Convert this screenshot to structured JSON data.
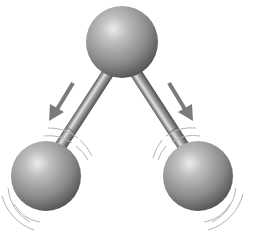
{
  "diagram": {
    "type": "molecular-vibration",
    "background": "#ffffff",
    "colors": {
      "atom_highlight": "#e6e6e6",
      "atom_mid": "#9a9a9a",
      "atom_shadow": "#4a4a4a",
      "bond_light": "#d8d8d8",
      "bond_dark": "#555555",
      "arrow": "#7a7a7a",
      "vibration_lines": "#b0b0b0"
    },
    "atoms": [
      {
        "id": "center-atom",
        "cx": 122,
        "cy": 42,
        "r": 36
      },
      {
        "id": "left-atom",
        "cx": 46,
        "cy": 176,
        "r": 35
      },
      {
        "id": "right-atom",
        "cx": 198,
        "cy": 176,
        "r": 35
      }
    ],
    "bonds": [
      {
        "id": "left-bond",
        "from": "center-atom",
        "to": "left-atom"
      },
      {
        "id": "right-bond",
        "from": "center-atom",
        "to": "right-atom"
      }
    ],
    "arrows": [
      {
        "id": "left-arrow",
        "x1": 73,
        "y1": 83,
        "x2": 52,
        "y2": 118,
        "direction": "down-left"
      },
      {
        "id": "right-arrow",
        "x1": 169,
        "y1": 83,
        "x2": 190,
        "y2": 118,
        "direction": "down-right"
      }
    ],
    "labels": []
  }
}
